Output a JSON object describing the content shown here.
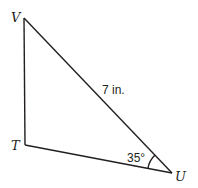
{
  "diagram": {
    "type": "right-triangle",
    "vertices": {
      "V": {
        "label": "V",
        "x": 24,
        "y": 18
      },
      "T": {
        "label": "T",
        "x": 25,
        "y": 145
      },
      "U": {
        "label": "U",
        "x": 172,
        "y": 173
      }
    },
    "edges": [
      {
        "from": "V",
        "to": "T"
      },
      {
        "from": "T",
        "to": "U"
      },
      {
        "from": "V",
        "to": "U",
        "label": "7 in."
      }
    ],
    "angle": {
      "vertex": "U",
      "label": "35°"
    },
    "colors": {
      "stroke": "#231f20",
      "background": "#ffffff"
    }
  }
}
